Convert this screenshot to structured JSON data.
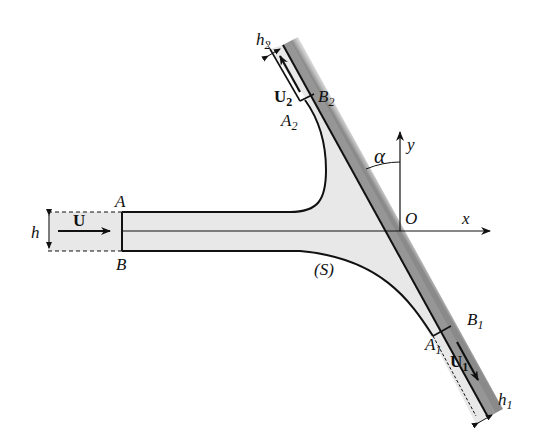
{
  "diagram": {
    "labels": {
      "inlet_top": "A",
      "inlet_bottom": "B",
      "inlet_velocity": "U",
      "inlet_width": "h",
      "outlet2_inner": "A",
      "outlet2_inner_sub": "2",
      "outlet2_wall": "B",
      "outlet2_wall_sub": "2",
      "outlet2_velocity": "U",
      "outlet2_velocity_sub": "2",
      "outlet2_width": "h",
      "outlet2_width_sub": "2",
      "outlet1_inner": "A",
      "outlet1_inner_sub": "1",
      "outlet1_wall": "B",
      "outlet1_wall_sub": "1",
      "outlet1_velocity": "U",
      "outlet1_velocity_sub": "1",
      "outlet1_width": "h",
      "outlet1_width_sub": "1",
      "origin": "O",
      "x_axis": "x",
      "y_axis": "y",
      "angle": "α",
      "free_surface": "(S)"
    },
    "colors": {
      "fluid": "#e8e8e8",
      "wall_shade": "#9a9a9a",
      "line": "#111111"
    }
  }
}
